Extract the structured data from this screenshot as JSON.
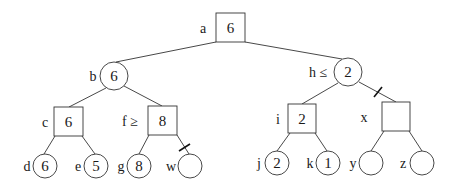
{
  "diagram": {
    "type": "game-tree (alpha-beta pruning)",
    "nodes": {
      "a": {
        "label": "a",
        "value": "6",
        "shape": "square",
        "role": "max"
      },
      "b": {
        "label": "b",
        "value": "6",
        "shape": "circle",
        "role": "min"
      },
      "h": {
        "label": "h ≤",
        "value": "2",
        "shape": "circle",
        "role": "min"
      },
      "c": {
        "label": "c",
        "value": "6",
        "shape": "square",
        "role": "max"
      },
      "f": {
        "label": "f ≥",
        "value": "8",
        "shape": "square",
        "role": "max"
      },
      "i": {
        "label": "i",
        "value": "2",
        "shape": "square",
        "role": "max"
      },
      "x": {
        "label": "x",
        "value": "",
        "shape": "square",
        "role": "max"
      },
      "d": {
        "label": "d",
        "value": "6",
        "shape": "circle",
        "role": "leaf"
      },
      "e": {
        "label": "e",
        "value": "5",
        "shape": "circle",
        "role": "leaf"
      },
      "g": {
        "label": "g",
        "value": "8",
        "shape": "circle",
        "role": "leaf"
      },
      "w": {
        "label": "w",
        "value": "",
        "shape": "circle",
        "role": "leaf"
      },
      "j": {
        "label": "j",
        "value": "2",
        "shape": "circle",
        "role": "leaf"
      },
      "k": {
        "label": "k",
        "value": "1",
        "shape": "circle",
        "role": "leaf"
      },
      "y": {
        "label": "y",
        "value": "",
        "shape": "circle",
        "role": "leaf"
      },
      "z": {
        "label": "z",
        "value": "",
        "shape": "circle",
        "role": "leaf"
      }
    },
    "edges": [
      {
        "from": "a",
        "to": "b",
        "pruned": false
      },
      {
        "from": "a",
        "to": "h",
        "pruned": false
      },
      {
        "from": "b",
        "to": "c",
        "pruned": false
      },
      {
        "from": "b",
        "to": "f",
        "pruned": false
      },
      {
        "from": "c",
        "to": "d",
        "pruned": false
      },
      {
        "from": "c",
        "to": "e",
        "pruned": false
      },
      {
        "from": "f",
        "to": "g",
        "pruned": false
      },
      {
        "from": "f",
        "to": "w",
        "pruned": true
      },
      {
        "from": "h",
        "to": "i",
        "pruned": false
      },
      {
        "from": "h",
        "to": "x",
        "pruned": true
      },
      {
        "from": "i",
        "to": "j",
        "pruned": false
      },
      {
        "from": "i",
        "to": "k",
        "pruned": false
      },
      {
        "from": "x",
        "to": "y",
        "pruned": false
      },
      {
        "from": "x",
        "to": "z",
        "pruned": false
      }
    ]
  }
}
